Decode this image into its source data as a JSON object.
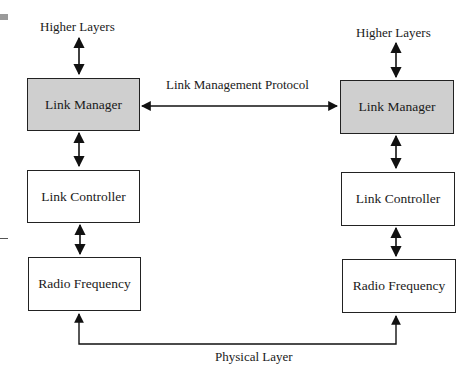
{
  "diagram": {
    "type": "protocol-stack",
    "left_stack": {
      "top_label": "Higher Layers",
      "layers": [
        {
          "name": "Link Manager",
          "shaded": true
        },
        {
          "name": "Link Controller",
          "shaded": false
        },
        {
          "name": "Radio Frequency",
          "shaded": false
        }
      ]
    },
    "right_stack": {
      "top_label": "Higher Layers",
      "layers": [
        {
          "name": "Link Manager",
          "shaded": true
        },
        {
          "name": "Link Controller",
          "shaded": false
        },
        {
          "name": "Radio Frequency",
          "shaded": false
        }
      ]
    },
    "peer_links": {
      "link_manager": "Link Management Protocol",
      "physical": "Physical Layer"
    },
    "colors": {
      "shaded_fill": "#cfcfcf",
      "line": "#111111"
    }
  }
}
